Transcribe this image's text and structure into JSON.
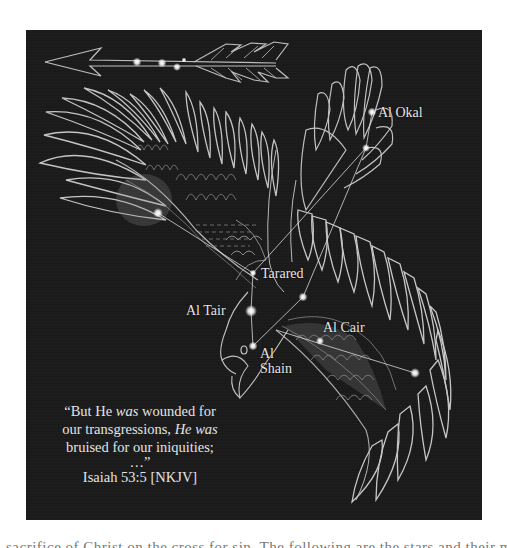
{
  "figure": {
    "background_color": "#1b1b1b",
    "line_color": "#cfcfcf",
    "star_color": "#ffffff",
    "arrow": {
      "stars": [
        {
          "x": 111,
          "y": 32
        },
        {
          "x": 136,
          "y": 33
        },
        {
          "x": 151,
          "y": 37
        },
        {
          "x": 158,
          "y": 30
        }
      ]
    },
    "stars": [
      {
        "id": "al-okal",
        "label": "Al  Okal",
        "x": 346,
        "y": 82
      },
      {
        "id": "okal-2",
        "label": "",
        "x": 340,
        "y": 118
      },
      {
        "id": "left-wing",
        "label": "",
        "x": 132,
        "y": 183
      },
      {
        "id": "tarared",
        "label": "Tarared",
        "x": 227,
        "y": 243
      },
      {
        "id": "al-tair",
        "label": "Al Tair",
        "x": 225,
        "y": 281
      },
      {
        "id": "al-shain",
        "label": "Al\nShain",
        "x": 227,
        "y": 316
      },
      {
        "id": "mid-star",
        "label": "",
        "x": 277,
        "y": 267
      },
      {
        "id": "al-cair",
        "label": "Al Cair",
        "x": 294,
        "y": 311
      },
      {
        "id": "tail-star",
        "label": "",
        "x": 389,
        "y": 343
      }
    ],
    "labels": {
      "al_okal": "Al  Okal",
      "tarared": "Tarared",
      "al_tair": "Al Tair",
      "al_cair": "Al Cair",
      "al_shain_1": "Al",
      "al_shain_2": "Shain"
    },
    "quote": {
      "line1_a": "“But He ",
      "line1_em": "was",
      "line1_b": " wounded for",
      "line2_a": "our transgressions, ",
      "line2_em": "He was",
      "line3": "bruised for our iniquities;",
      "line4": "…”",
      "reference": "Isaiah 53:5 [NKJV]"
    }
  },
  "caption_fragment": "sacrifice of Christ on the cross for sin. The following are the stars and their meanings:"
}
